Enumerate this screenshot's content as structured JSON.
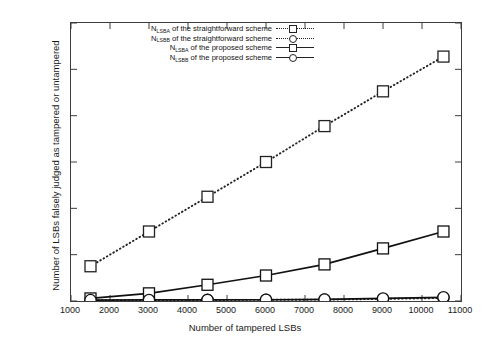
{
  "chart_data": {
    "type": "line",
    "title": "",
    "xlabel": "Number of tampered LSBs",
    "ylabel": "Number of LSBs falsely judged as tampered or untampered",
    "xlim": [
      1000,
      11000
    ],
    "ylim": [
      0,
      12000
    ],
    "xticks": [
      1000,
      2000,
      3000,
      4000,
      5000,
      6000,
      7000,
      8000,
      9000,
      10000,
      11000
    ],
    "yticks": [
      0,
      2000,
      4000,
      6000,
      8000,
      10000,
      12000
    ],
    "xticklabels": [
      "1000",
      "2000",
      "3000",
      "4000",
      "5000",
      "6000",
      "7000",
      "8000",
      "9000",
      "10000",
      "11000"
    ],
    "yticklabels": [
      "0",
      "2000",
      "4000",
      "6000",
      "8000",
      "10000",
      "12000"
    ],
    "grid": false,
    "legend_position": "upper-left-inside",
    "x": [
      1500,
      3000,
      4500,
      6000,
      7500,
      9000,
      10550
    ],
    "series": [
      {
        "name": "N_LSBA of the straightforward scheme",
        "label_main": "N",
        "label_sub": "LSBA",
        "label_rest": " of the straightforward scheme",
        "linestyle": "dotted",
        "marker": "square",
        "color": "#222222",
        "values": [
          1500,
          3000,
          4500,
          6000,
          7550,
          9050,
          10550
        ]
      },
      {
        "name": "N_LSBB of the straightforward scheme",
        "label_main": "N",
        "label_sub": "LSBB",
        "label_rest": " of the straightforward scheme",
        "linestyle": "dotted",
        "marker": "circle",
        "color": "#222222",
        "values": [
          30,
          40,
          45,
          50,
          60,
          90,
          130
        ]
      },
      {
        "name": "N_LSBA of the proposed scheme",
        "label_main": "N",
        "label_sub": "LSBA",
        "label_rest": " of the proposed scheme",
        "linestyle": "solid",
        "marker": "square",
        "color": "#111111",
        "values": [
          110,
          330,
          700,
          1100,
          1580,
          2270,
          3000
        ]
      },
      {
        "name": "N_LSBB of the proposed scheme",
        "label_main": "N",
        "label_sub": "LSBB",
        "label_rest": " of the proposed scheme",
        "linestyle": "solid",
        "marker": "circle",
        "color": "#111111",
        "values": [
          40,
          45,
          50,
          55,
          70,
          110,
          160
        ]
      }
    ]
  }
}
